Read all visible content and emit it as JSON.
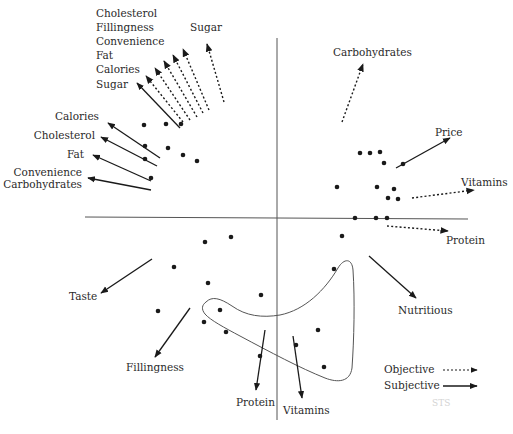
{
  "figure": {
    "type": "biplot",
    "axes": {
      "horizontal": {
        "x1": 85,
        "y1": 217,
        "x2": 468,
        "y2": 219
      },
      "vertical": {
        "x1": 277,
        "y1": 38,
        "x2": 277,
        "y2": 420
      }
    },
    "colors": {
      "ink": "#1a1a1a",
      "text": "#2a2a2a",
      "axis": "#555555",
      "curve": "#555555"
    },
    "legend": {
      "objective_label": "Objective",
      "subjective_label": "Subjective",
      "watermark": "STS"
    },
    "objective_vectors": [
      {
        "label": "Cholesterol",
        "x1": 183,
        "y1": 122,
        "x2": 146,
        "y2": 76
      },
      {
        "label": "Fillingness",
        "x1": 190,
        "y1": 120,
        "x2": 155,
        "y2": 68
      },
      {
        "label": "Convenience",
        "x1": 197,
        "y1": 117,
        "x2": 164,
        "y2": 61
      },
      {
        "label": "Fat",
        "x1": 203,
        "y1": 113,
        "x2": 173,
        "y2": 55
      },
      {
        "label": "Calories",
        "x1": 209,
        "y1": 110,
        "x2": 183,
        "y2": 49
      },
      {
        "label": "Sugar",
        "x1": 224,
        "y1": 102,
        "x2": 207,
        "y2": 44
      },
      {
        "label": "Carbohydrates",
        "x1": 342,
        "y1": 122,
        "x2": 363,
        "y2": 64
      },
      {
        "label": "Vitamins",
        "x1": 412,
        "y1": 198,
        "x2": 474,
        "y2": 190
      },
      {
        "label": "Protein",
        "x1": 387,
        "y1": 226,
        "x2": 448,
        "y2": 231
      }
    ],
    "subjective_vectors": [
      {
        "label": "Sugar",
        "x1": 180,
        "y1": 128,
        "x2": 137,
        "y2": 83
      },
      {
        "label": "Calories",
        "x1": 160,
        "y1": 158,
        "x2": 108,
        "y2": 123
      },
      {
        "label": "Cholesterol",
        "x1": 157,
        "y1": 166,
        "x2": 101,
        "y2": 137
      },
      {
        "label": "Fat",
        "x1": 151,
        "y1": 181,
        "x2": 93,
        "y2": 155
      },
      {
        "label": "Convenience / Carbohydrates",
        "x1": 151,
        "y1": 190,
        "x2": 88,
        "y2": 178
      },
      {
        "label": "Price",
        "x1": 396,
        "y1": 168,
        "x2": 450,
        "y2": 138
      },
      {
        "label": "Nutritious",
        "x1": 369,
        "y1": 256,
        "x2": 416,
        "y2": 298
      },
      {
        "label": "Taste",
        "x1": 152,
        "y1": 259,
        "x2": 101,
        "y2": 293
      },
      {
        "label": "Fillingness",
        "x1": 190,
        "y1": 308,
        "x2": 155,
        "y2": 357
      },
      {
        "label": "Protein",
        "x1": 265,
        "y1": 330,
        "x2": 256,
        "y2": 390
      },
      {
        "label": "Vitamins",
        "x1": 293,
        "y1": 336,
        "x2": 302,
        "y2": 398
      }
    ],
    "labels": {
      "stack_top_left": [
        "Cholesterol",
        "Fillingness",
        "Convenience",
        "Fat",
        "Calories",
        "Sugar"
      ],
      "sugar_top": "Sugar",
      "carbohydrates_top": "Carbohydrates",
      "left_calories": "Calories",
      "left_cholesterol": "Cholesterol",
      "left_fat": "Fat",
      "left_convenience": "Convenience",
      "left_carbohydrates": "Carbohydrates",
      "price": "Price",
      "vitamins_right": "Vitamins",
      "protein_right": "Protein",
      "nutritious": "Nutritious",
      "taste": "Taste",
      "fillingness_bottom": "Fillingness",
      "protein_bottom": "Protein",
      "vitamins_bottom": "Vitamins"
    },
    "points": [
      [
        144,
        125
      ],
      [
        166,
        124
      ],
      [
        181,
        124
      ],
      [
        145,
        146
      ],
      [
        168,
        148
      ],
      [
        183,
        155
      ],
      [
        197,
        161
      ],
      [
        145,
        159
      ],
      [
        151,
        178
      ],
      [
        360,
        153
      ],
      [
        370,
        153
      ],
      [
        380,
        152
      ],
      [
        384,
        163
      ],
      [
        403,
        164
      ],
      [
        337,
        187
      ],
      [
        377,
        187
      ],
      [
        394,
        189
      ],
      [
        388,
        198
      ],
      [
        398,
        199
      ],
      [
        355,
        218
      ],
      [
        376,
        218
      ],
      [
        387,
        218
      ],
      [
        342,
        236
      ],
      [
        205,
        242
      ],
      [
        231,
        237
      ],
      [
        174,
        267
      ],
      [
        208,
        283
      ],
      [
        261,
        295
      ],
      [
        220,
        310
      ],
      [
        158,
        311
      ],
      [
        204,
        322
      ],
      [
        226,
        332
      ],
      [
        334,
        269
      ],
      [
        318,
        330
      ],
      [
        296,
        345
      ],
      [
        324,
        367
      ],
      [
        260,
        356
      ]
    ],
    "cluster_outline": "M 206 302 C 212 296, 220 298, 232 306 C 246 316, 262 318, 280 315 C 305 310, 325 290, 338 268 C 344 258, 352 258, 353 270 C 355 300, 354 340, 352 368 C 350 382, 338 383, 325 378 C 300 368, 270 352, 240 336 C 225 328, 210 320, 205 314 C 201 309, 202 305, 206 302 Z"
  }
}
